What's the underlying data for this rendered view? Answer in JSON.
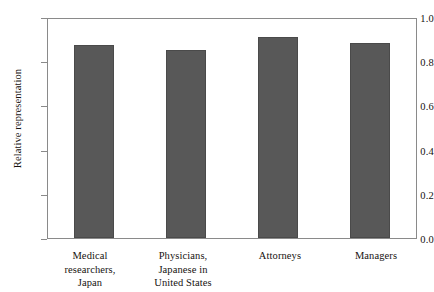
{
  "chart_data": {
    "type": "bar",
    "title": "",
    "xlabel": "",
    "ylabel": "Relative representation",
    "ylim": [
      0.0,
      1.0
    ],
    "yticks": [
      "0.0",
      "0.2",
      "0.4",
      "0.6",
      "0.8",
      "1.0"
    ],
    "ytick_values": [
      0.0,
      0.2,
      0.4,
      0.6,
      0.8,
      1.0
    ],
    "grid": false,
    "legend": null,
    "bar_color": "#585858",
    "frame_color": "#8a8a8a",
    "categories": [
      "Medical researchers, Japan",
      "Physicians, Japanese in United States",
      "Attorneys",
      "Managers"
    ],
    "category_lines": [
      [
        "Medical",
        "researchers,",
        "Japan"
      ],
      [
        "Physicians,",
        "Japanese in",
        "United States"
      ],
      [
        "Attorneys"
      ],
      [
        "Managers"
      ]
    ],
    "values": [
      0.88,
      0.86,
      0.92,
      0.89
    ]
  }
}
